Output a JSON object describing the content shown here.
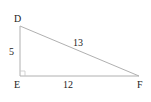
{
  "diagram": {
    "type": "right-triangle",
    "vertices": [
      {
        "label": "D",
        "x": 20,
        "y": 26
      },
      {
        "label": "E",
        "x": 20,
        "y": 76
      },
      {
        "label": "F",
        "x": 139,
        "y": 76
      }
    ],
    "sides": [
      {
        "between": "DE",
        "length": "5"
      },
      {
        "between": "DF",
        "length": "13"
      },
      {
        "between": "EF",
        "length": "12"
      }
    ],
    "right_angle_at": "E",
    "line_color": "#aaaaaa"
  }
}
